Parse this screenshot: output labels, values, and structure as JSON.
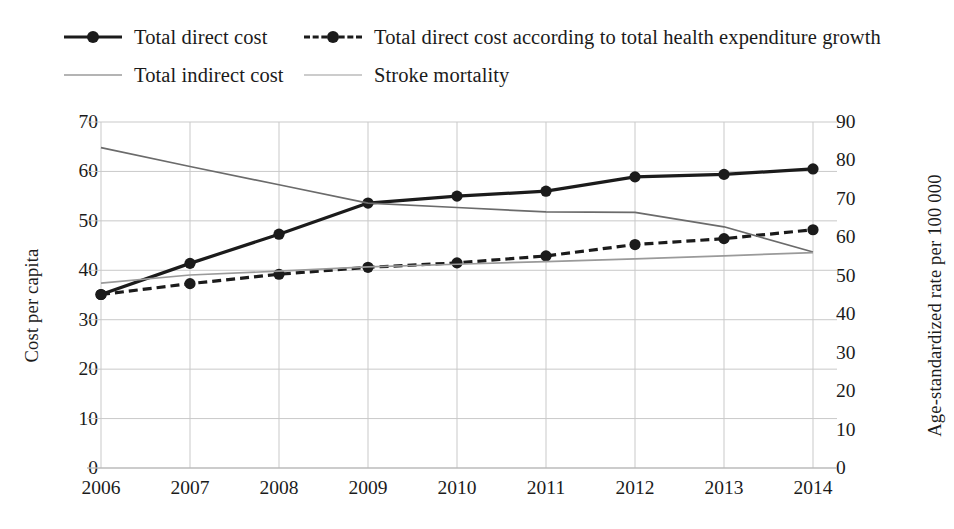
{
  "legend": {
    "rows": [
      [
        {
          "label": "Total direct cost",
          "style": "solid-marker",
          "color": "#1b1b1b",
          "width": 3.2,
          "marker": true
        },
        {
          "label": "Total direct cost according to total health expenditure growth",
          "style": "dashed-marker",
          "color": "#1b1b1b",
          "width": 3.2,
          "marker": true
        }
      ],
      [
        {
          "label": "Total indirect cost",
          "style": "solid",
          "color": "#6b6b6b",
          "width": 1.6,
          "marker": false
        },
        {
          "label": "Stroke mortality",
          "style": "solid",
          "color": "#9a9a9a",
          "width": 1.6,
          "marker": false
        }
      ]
    ]
  },
  "chart_data": {
    "type": "line",
    "title": "",
    "xlabel": "",
    "ylabel": "Cost per capita",
    "y2label": "Age-standardized rate per 100 000",
    "categories": [
      "2006",
      "2007",
      "2008",
      "2009",
      "2010",
      "2011",
      "2012",
      "2013",
      "2014"
    ],
    "ylim": [
      0,
      70
    ],
    "yticks": [
      0,
      10,
      20,
      30,
      40,
      50,
      60,
      70
    ],
    "y2lim": [
      0,
      90
    ],
    "y2ticks": [
      0,
      10,
      20,
      30,
      40,
      50,
      60,
      70,
      80,
      90
    ],
    "grid": true,
    "legend_position": "top",
    "series": [
      {
        "name": "Total direct cost",
        "axis": "left",
        "style": "solid",
        "marker": true,
        "color": "#1b1b1b",
        "width": 3.2,
        "values": [
          35.1,
          41.4,
          47.3,
          53.6,
          55.0,
          56.0,
          58.9,
          59.4,
          60.5
        ]
      },
      {
        "name": "Total direct cost according to total health expenditure growth",
        "axis": "left",
        "style": "dashed",
        "marker": true,
        "color": "#1b1b1b",
        "width": 3.2,
        "values": [
          35.1,
          37.3,
          39.2,
          40.6,
          41.5,
          42.9,
          45.2,
          46.4,
          48.2
        ]
      },
      {
        "name": "Total indirect cost",
        "axis": "left",
        "style": "solid",
        "marker": false,
        "color": "#6b6b6b",
        "width": 1.7,
        "values": [
          64.8,
          61.0,
          57.3,
          53.6,
          52.7,
          51.8,
          51.7,
          48.8,
          43.7
        ]
      },
      {
        "name": "Stroke mortality",
        "axis": "right",
        "style": "solid",
        "marker": false,
        "color": "#9a9a9a",
        "width": 1.7,
        "values": [
          48.1,
          50.2,
          51.2,
          52.3,
          53.0,
          53.7,
          54.4,
          55.2,
          56.0
        ]
      }
    ]
  }
}
